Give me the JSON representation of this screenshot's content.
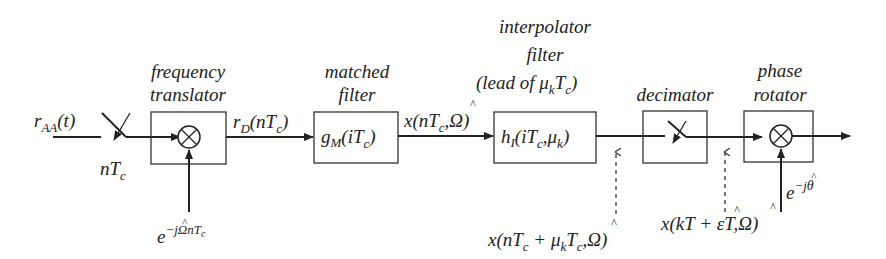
{
  "diagram": {
    "type": "block-diagram",
    "input": {
      "signal": "r_AA(t)",
      "sampler_label": "nT_c"
    },
    "blocks": [
      {
        "id": "frequency-translator",
        "caption_lines": [
          "frequency",
          "translator"
        ],
        "content": "multiplier",
        "side_input": "e^{-jΩ̂ nT_c}"
      },
      {
        "id": "matched-filter",
        "caption_lines": [
          "matched",
          "filter"
        ],
        "content": "g_M(iT_c)"
      },
      {
        "id": "interpolator-filter",
        "caption_lines": [
          "interpolator",
          "filter",
          "(lead of μ_k T_c)"
        ],
        "content": "h_I(iT_c, μ_k)"
      },
      {
        "id": "decimator",
        "caption_lines": [
          "decimator"
        ],
        "content": "switch"
      },
      {
        "id": "phase-rotator",
        "caption_lines": [
          "phase",
          "rotator"
        ],
        "content": "multiplier",
        "side_input": "e^{-jθ̂}"
      }
    ],
    "edges": [
      {
        "from": "input",
        "to": "frequency-translator",
        "label": ""
      },
      {
        "from": "frequency-translator",
        "to": "matched-filter",
        "label": "r_D(nT_c)"
      },
      {
        "from": "matched-filter",
        "to": "interpolator-filter",
        "label": "x(nT_c, Ω̂)"
      },
      {
        "from": "interpolator-filter",
        "to": "decimator",
        "label": "x(nT_c + μ_k T_c, Ω̂)",
        "label_style": "dashed-pointer-below"
      },
      {
        "from": "decimator",
        "to": "phase-rotator",
        "label": "x(kT + ε̂T, Ω̂)",
        "label_style": "dashed-pointer-below"
      },
      {
        "from": "phase-rotator",
        "to": "output",
        "label": ""
      }
    ]
  },
  "text": {
    "r": "r",
    "AA": "AA",
    "t_paren": "(t)",
    "n": "n",
    "T": "T",
    "c": "c",
    "freq_cap1": "frequency",
    "freq_cap2": "translator",
    "e": "e",
    "minus_j": "−j",
    "omega": "Ω",
    "hat": "^",
    "nTc_exp": "nT",
    "rD_r": "r",
    "rD_D": "D",
    "rD_open": "(nT",
    "close": ")",
    "mf_cap1": "matched",
    "mf_cap2": "filter",
    "g": "g",
    "M": "M",
    "iTc_open": "(iT",
    "x_open": "x(nT",
    "comma_omega": ",Ω",
    "ip_cap1": "interpolator",
    "ip_cap2": "filter",
    "ip_cap3_a": "(lead of μ",
    "k": "k",
    "h": "h",
    "I": "I",
    "comma_mu": ",μ",
    "dec_cap": "decimator",
    "pr_cap1": "phase",
    "pr_cap2": "rotator",
    "theta": "θ",
    "plus_mu": " + μ",
    "xk_open": "x(kT + ",
    "eps": "ε",
    "T_comma_omega": "T,Ω"
  }
}
